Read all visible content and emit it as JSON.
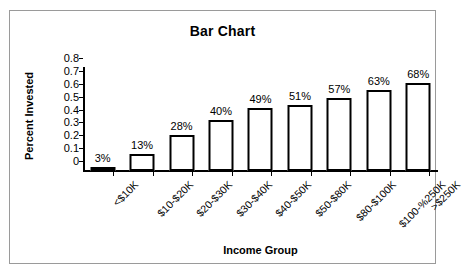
{
  "chart_data": {
    "type": "bar",
    "title": "Bar Chart",
    "xlabel": "Income Group",
    "ylabel": "Percent Invested",
    "categories": [
      "<$10K",
      "$10-$20K",
      "$20-$30K",
      "$30-$40K",
      "$40-$50K",
      "$50-$80K",
      "$80-$100K",
      "$100-%250K",
      ">$250K"
    ],
    "values": [
      0.03,
      0.13,
      0.28,
      0.4,
      0.49,
      0.51,
      0.57,
      0.63,
      0.68
    ],
    "data_labels": [
      "3%",
      "13%",
      "28%",
      "40%",
      "49%",
      "51%",
      "57%",
      "63%",
      "68%"
    ],
    "ylim": [
      0,
      0.8
    ],
    "ytick_labels": [
      "0.8",
      "0.7",
      "0.6",
      "0.5",
      "0.4",
      "0.3",
      "0.2",
      "0.1",
      "0"
    ],
    "ytick_values": [
      0.8,
      0.7,
      0.6,
      0.5,
      0.4,
      0.3,
      0.2,
      0.1,
      0
    ],
    "grid": false,
    "legend": false,
    "bar_fill_color": "#ffffff",
    "bar_outline_color": "#000000",
    "axis_color": "#000000",
    "frame_color": "#9a9a9a",
    "background_color": "#ffffff"
  }
}
